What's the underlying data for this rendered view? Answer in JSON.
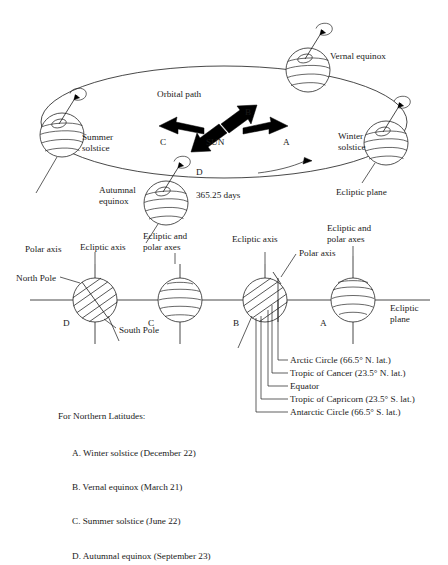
{
  "figure": {
    "title_upper": "Orbital path diagram of Earth around the Sun",
    "upper": {
      "orbital_path_label": "Orbital path",
      "sun_label": "SUN",
      "arrow_a": "A",
      "arrow_b": "B",
      "arrow_c": "C",
      "arrow_d": "D",
      "period_label": "365.25 days",
      "vernal_equinox": "Vernal equinox",
      "summer_solstice": "Summer\nsolstice",
      "winter_solstice": "Winter\nsolstice",
      "autumnal_equinox": "Autumnal\nequinox",
      "ecliptic_plane": "Ecliptic plane"
    },
    "lower": {
      "polar_axis_left": "Polar axis",
      "ecliptic_axis_left": "Ecliptic axis",
      "north_pole": "North Pole",
      "south_pole": "South Pole",
      "ecliptic_and_polar_axes_1": "Ecliptic and\npolar axes",
      "ecliptic_axis_b": "Ecliptic axis",
      "polar_axis_b": "Polar axis",
      "ecliptic_and_polar_axes_2": "Ecliptic and\npolar axes",
      "ecliptic_plane": "Ecliptic\nplane",
      "globe_d": "D",
      "globe_c": "C",
      "globe_b": "B",
      "globe_a": "A"
    },
    "latitude_callouts": [
      "Arctic Circle (66.5° N. lat.)",
      "Tropic of Cancer (23.5° N. lat.)",
      "Equator",
      "Tropic of Capricorn (23.5° S. lat.)",
      "Antarctic Circle (66.5° S. lat.)"
    ],
    "legend": {
      "heading": "For Northern Latitudes:",
      "items": [
        "A. Winter solstice (December 22)",
        "B. Vernal equinox (March 21)",
        "C. Summer solstice (June 22)",
        "D. Autumnal equinox (September 23)"
      ]
    },
    "colors": {
      "ink": "#1a1a1a",
      "line": "#262626",
      "background": "#ffffff"
    }
  }
}
